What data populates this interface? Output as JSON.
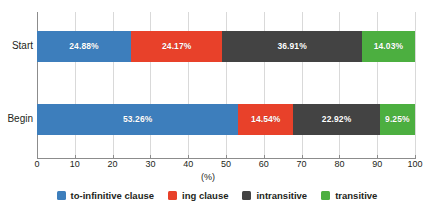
{
  "chart_data": {
    "type": "bar",
    "orientation": "horizontal",
    "stacked": true,
    "normalized": true,
    "title": "",
    "xlabel": "(%)",
    "ylabel": "",
    "xlim": [
      0,
      100
    ],
    "xticks": [
      0,
      10,
      20,
      30,
      40,
      50,
      60,
      70,
      80,
      90,
      100
    ],
    "xtick_labels": [
      "0",
      "10",
      "20",
      "30",
      "40",
      "50",
      "60",
      "70",
      "80",
      "90",
      "100"
    ],
    "grid": true,
    "grid_axis": "x",
    "legend_position": "bottom",
    "categories": [
      "Start",
      "Begin"
    ],
    "series": [
      {
        "name": "to-infinitive clause",
        "color": "#3d7ebc",
        "values": [
          24.88,
          53.26
        ],
        "labels": [
          "24.88%",
          "53.26%"
        ]
      },
      {
        "name": "ing clause",
        "color": "#e8412a",
        "values": [
          24.17,
          14.54
        ],
        "labels": [
          "24.17%",
          "14.54%"
        ]
      },
      {
        "name": "intransitive",
        "color": "#434343",
        "values": [
          36.91,
          22.92
        ],
        "labels": [
          "36.91%",
          "22.92%"
        ]
      },
      {
        "name": "transitive",
        "color": "#4caf40",
        "values": [
          14.03,
          9.25
        ],
        "labels": [
          "14.03%",
          "9.25%"
        ]
      }
    ]
  },
  "axis": {
    "x_title": "(%)"
  },
  "legend": {
    "items": [
      {
        "label": "to-infinitive clause",
        "color": "#3d7ebc"
      },
      {
        "label": "ing clause",
        "color": "#e8412a"
      },
      {
        "label": "intransitive",
        "color": "#434343"
      },
      {
        "label": "transitive",
        "color": "#4caf40"
      }
    ]
  }
}
